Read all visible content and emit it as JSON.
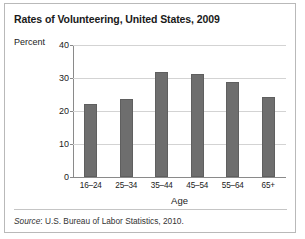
{
  "figure": {
    "title": "Rates of Volunteering, United States, 2009",
    "source_word": "Source",
    "source_rest": ": U.S. Bureau of Labor Statistics, 2010."
  },
  "chart_data": {
    "type": "bar",
    "title": "Rates of Volunteering, United States, 2009",
    "xlabel": "Age",
    "ylabel": "Percent",
    "categories": [
      "16–24",
      "25–34",
      "35–44",
      "45–54",
      "55–64",
      "65+"
    ],
    "values": [
      22.2,
      23.7,
      31.8,
      31.2,
      28.8,
      24.3
    ],
    "ylim": [
      0,
      40
    ],
    "yticks": [
      0,
      10,
      20,
      30,
      40
    ],
    "ytick_labels": [
      "0",
      "10",
      "20",
      "30",
      "40"
    ],
    "grid": true,
    "legend": false,
    "bar_color": "#6e6e6e"
  }
}
